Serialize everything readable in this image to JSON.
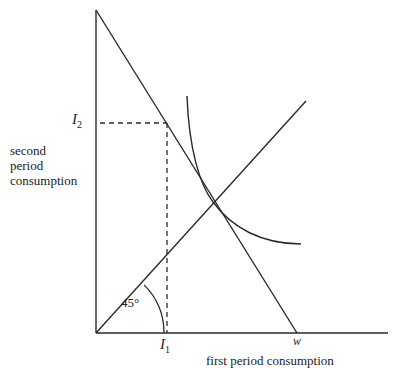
{
  "diagram": {
    "y_axis_label": [
      "second",
      "period",
      "consumption"
    ],
    "x_axis_label": "first period consumption",
    "labels": {
      "I2": {
        "main": "I",
        "sub": "2"
      },
      "I1": {
        "main": "I",
        "sub": "1"
      },
      "w": "w",
      "angle": "45°"
    },
    "elements": [
      {
        "id": "vertical-axis",
        "type": "line",
        "from": [
          96,
          10
        ],
        "to": [
          96,
          333
        ]
      },
      {
        "id": "horizontal-axis",
        "type": "line",
        "from": [
          96,
          333
        ],
        "to": [
          388,
          333
        ]
      },
      {
        "id": "budget-line",
        "type": "line",
        "from": [
          96,
          10
        ],
        "to": [
          297,
          333
        ]
      },
      {
        "id": "forty-five-degree-line",
        "type": "line",
        "from": [
          96,
          333
        ],
        "to": [
          306,
          101
        ]
      },
      {
        "id": "indifference-curve",
        "type": "curve",
        "tangent_point": [
          213,
          202
        ]
      },
      {
        "id": "dashed-I2",
        "type": "dashed-line",
        "from": [
          100,
          123
        ],
        "to": [
          167,
          123
        ]
      },
      {
        "id": "dashed-I1",
        "type": "dashed-line",
        "from": [
          167,
          123
        ],
        "to": [
          167,
          333
        ]
      },
      {
        "id": "angle-arc",
        "type": "arc",
        "center": [
          96,
          333
        ],
        "radius": 68,
        "degrees": 45
      }
    ],
    "stroke_color": "#2a2a2a"
  }
}
